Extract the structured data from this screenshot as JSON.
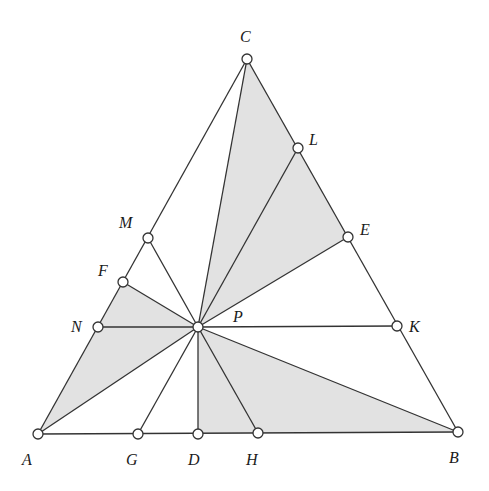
{
  "diagram": {
    "shade_color": "#e2e2e2",
    "line_color": "#333333",
    "points": [
      {
        "id": "A",
        "label": "A",
        "x": 38,
        "y": 434,
        "lx": 22,
        "ly": 465
      },
      {
        "id": "B",
        "label": "B",
        "x": 458,
        "y": 432,
        "lx": 449,
        "ly": 463
      },
      {
        "id": "C",
        "label": "C",
        "x": 247,
        "y": 59,
        "lx": 240,
        "ly": 42
      },
      {
        "id": "D",
        "label": "D",
        "x": 198,
        "y": 434,
        "lx": 188,
        "ly": 465
      },
      {
        "id": "E",
        "label": "E",
        "x": 348,
        "y": 237,
        "lx": 360,
        "ly": 235
      },
      {
        "id": "F",
        "label": "F",
        "x": 123,
        "y": 282,
        "lx": 98,
        "ly": 276
      },
      {
        "id": "G",
        "label": "G",
        "x": 138,
        "y": 434,
        "lx": 126,
        "ly": 465
      },
      {
        "id": "H",
        "label": "H",
        "x": 258,
        "y": 433,
        "lx": 246,
        "ly": 465
      },
      {
        "id": "K",
        "label": "K",
        "x": 397,
        "y": 326,
        "lx": 409,
        "ly": 332
      },
      {
        "id": "L",
        "label": "L",
        "x": 298,
        "y": 148,
        "lx": 309,
        "ly": 145
      },
      {
        "id": "M",
        "label": "M",
        "x": 148,
        "y": 238,
        "lx": 119,
        "ly": 228
      },
      {
        "id": "N",
        "label": "N",
        "x": 98,
        "y": 327,
        "lx": 71,
        "ly": 332
      },
      {
        "id": "P",
        "label": "P",
        "x": 198,
        "y": 327,
        "lx": 233,
        "ly": 322
      }
    ],
    "shaded_triangles": [
      [
        "P",
        "C",
        "L"
      ],
      [
        "P",
        "L",
        "E"
      ],
      [
        "P",
        "F",
        "N"
      ],
      [
        "P",
        "N",
        "A"
      ],
      [
        "P",
        "D",
        "H"
      ],
      [
        "P",
        "H",
        "B"
      ]
    ],
    "segments": [
      [
        "A",
        "B"
      ],
      [
        "B",
        "C"
      ],
      [
        "C",
        "A"
      ],
      [
        "P",
        "C"
      ],
      [
        "P",
        "L"
      ],
      [
        "P",
        "E"
      ],
      [
        "P",
        "K"
      ],
      [
        "P",
        "N"
      ],
      [
        "P",
        "F"
      ],
      [
        "P",
        "M"
      ],
      [
        "P",
        "A"
      ],
      [
        "P",
        "G"
      ],
      [
        "P",
        "D"
      ],
      [
        "P",
        "H"
      ],
      [
        "P",
        "B"
      ]
    ]
  }
}
